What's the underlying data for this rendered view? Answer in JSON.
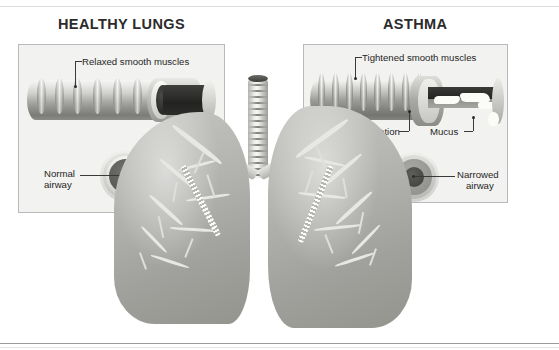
{
  "figure": {
    "kind": "medical-illustration",
    "style": "grayscale scanned textbook figure",
    "background_color": "#ffffff"
  },
  "panels": {
    "healthy": {
      "title": "HEALTHY LUNGS",
      "labels": {
        "muscles": "Relaxed smooth muscles",
        "airway_line1": "Normal",
        "airway_line2": "airway"
      }
    },
    "asthma": {
      "title": "ASTHMA",
      "labels": {
        "muscles": "Tightened smooth muscles",
        "inflammation": "Inflammation",
        "mucus": "Mucus",
        "airway_line1": "Narrowed",
        "airway_line2": "airway"
      }
    }
  },
  "anatomy": {
    "trachea": "trachea",
    "left_lung": "left lung",
    "right_lung": "right lung",
    "bronchial_tree": "bronchial tree"
  },
  "colors": {
    "panel_border": "#b9b9b9",
    "panel_fill": "#f2f2f0",
    "title_text": "#2b2b2b",
    "label_text": "#1f1f1f",
    "leader_line": "#3a3a3a",
    "lung_tissue": "#b0b0ac",
    "lumen_dark": "#2a2a28",
    "mucus_white": "#fbfbf7",
    "rule": "#9a9a9a"
  }
}
